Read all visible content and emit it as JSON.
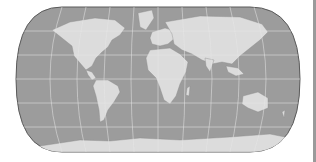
{
  "map": {
    "projection": "Robinson-like pseudocylindrical world map",
    "ocean_color": "#9c9c9c",
    "land_color": "#dcdcdc",
    "graticule_color": "#e6e6e6",
    "border_color": "#5a5a5a",
    "background": "#ffffff"
  },
  "divider": {
    "color": "#9a9a9a"
  }
}
